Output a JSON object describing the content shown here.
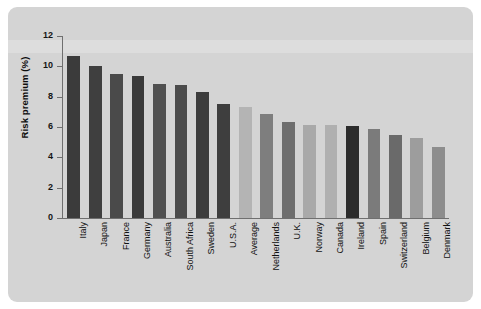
{
  "chart_data": {
    "type": "bar",
    "title": "",
    "xlabel": "",
    "ylabel": "Risk premium (%)",
    "ylim": [
      0,
      12
    ],
    "yticks": [
      "0",
      "2",
      "4",
      "6",
      "8",
      "10",
      "12"
    ],
    "grid": false,
    "legend": "none",
    "categories": [
      "Italy",
      "Japan",
      "France",
      "Germany",
      "Australia",
      "South Africa",
      "Sweden",
      "U.S.A.",
      "Average",
      "Netherlands",
      "U.K.",
      "Norway",
      "Canada",
      "Ireland",
      "Spain",
      "Switzerland",
      "Belgium",
      "Denmark"
    ],
    "values": [
      10.7,
      10.0,
      9.5,
      9.35,
      8.85,
      8.75,
      8.3,
      7.55,
      7.3,
      6.85,
      6.3,
      6.15,
      6.1,
      6.05,
      5.9,
      5.45,
      5.3,
      4.7
    ],
    "bar_colors": [
      "#3b3b3b",
      "#3f3f3f",
      "#4a4a4a",
      "#3a3a3a",
      "#505050",
      "#4b4b4b",
      "#3c3c3c",
      "#3e3e3e",
      "#b4b4b4",
      "#7e7e7e",
      "#6e6e6e",
      "#a9a9a9",
      "#b0b0b0",
      "#2c2c2c",
      "#7b7b7b",
      "#6a6a6a",
      "#9d9d9d",
      "#8d8d8d"
    ]
  },
  "colors": {
    "panel_background": "#d4d4d4",
    "page_background": "#ffffff",
    "axis": "#6f6f6f",
    "text": "#111111"
  }
}
